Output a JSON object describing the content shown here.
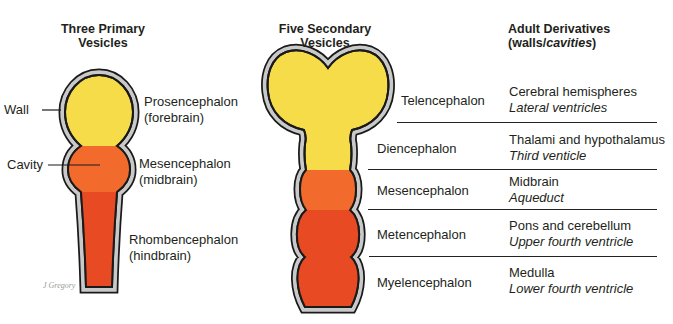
{
  "left_panel": {
    "title_line1": "Three Primary",
    "title_line2": "Vesicles",
    "callouts": {
      "wall": "Wall",
      "cavity": "Cavity"
    },
    "vesicles": [
      {
        "name": "Prosencephalon",
        "common": "(forebrain)",
        "color": "#f6dc48"
      },
      {
        "name": "Mesencephalon",
        "common": "(midbrain)",
        "color": "#f26b2d"
      },
      {
        "name": "Rhombencephalon",
        "common": "(hindbrain)",
        "color": "#e84b24"
      }
    ],
    "credit": "J Gregory"
  },
  "middle_panel": {
    "title_line1": "Five Secondary",
    "title_line2": "Vesicles",
    "vesicles": [
      {
        "name": "Telencephalon",
        "color": "#f6dc48"
      },
      {
        "name": "Diencephalon",
        "color": "#f6dc48"
      },
      {
        "name": "Mesencephalon",
        "color": "#f26b2d"
      },
      {
        "name": "Metencephalon",
        "color": "#e84b24"
      },
      {
        "name": "Myelencephalon",
        "color": "#e84b24"
      }
    ]
  },
  "right_panel": {
    "title_line1": "Adult Derivatives",
    "title_prefix": "(walls/",
    "title_italic": "cavities",
    "title_suffix": ")",
    "derivatives": [
      {
        "wall": "Cerebral hemispheres",
        "cavity": "Lateral ventricles"
      },
      {
        "wall": "Thalami and hypothalamus",
        "cavity": "Third venticle"
      },
      {
        "wall": "Midbrain",
        "cavity": "Aqueduct"
      },
      {
        "wall": "Pons and cerebellum",
        "cavity": "Upper fourth ventricle"
      },
      {
        "wall": "Medulla",
        "cavity": "Lower fourth ventricle"
      }
    ]
  },
  "colors": {
    "wall": "#c9c9c9",
    "outline": "#1a1a1a"
  }
}
